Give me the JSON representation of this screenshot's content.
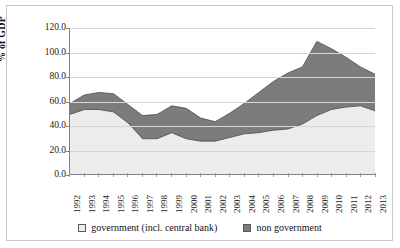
{
  "chart_data": {
    "type": "area",
    "title": "",
    "subtitle": "",
    "xlabel": "",
    "ylabel": "% of GDP",
    "stacked": true,
    "grid": true,
    "legend_position": "bottom",
    "ylim": [
      0,
      120
    ],
    "yticks": [
      "0.0",
      "20.0",
      "40.0",
      "60.0",
      "80.0",
      "100.0",
      "120.0"
    ],
    "ytick_values": [
      0,
      20,
      40,
      60,
      80,
      100,
      120
    ],
    "categories": [
      "1992",
      "1993",
      "1994",
      "1995",
      "1996",
      "1997",
      "1998",
      "1999",
      "2000",
      "2001",
      "2002",
      "2003",
      "2004",
      "2005",
      "2006",
      "2007",
      "2008",
      "2009",
      "2010",
      "2011",
      "2012",
      "2013"
    ],
    "series": [
      {
        "name": "government (incl. central bank)",
        "color": "#ececec",
        "values": [
          49,
          53,
          53,
          51,
          42,
          29,
          29,
          34,
          29,
          27,
          27,
          30,
          33,
          34,
          36,
          37,
          41,
          48,
          53,
          55,
          56,
          52
        ]
      },
      {
        "name": "non government",
        "color": "#7c7c7c",
        "values": [
          9,
          12,
          14,
          15,
          15,
          19,
          20,
          22,
          25,
          19,
          16,
          20,
          25,
          33,
          40,
          46,
          47,
          61,
          50,
          41,
          32,
          30
        ]
      }
    ],
    "totals": [
      58,
      65,
      67,
      66,
      57,
      48,
      49,
      56,
      54,
      46,
      43,
      50,
      58,
      67,
      76,
      83,
      88,
      109,
      103,
      96,
      88,
      82
    ]
  },
  "legend": {
    "items": [
      {
        "label": "government (incl. central bank)",
        "swatch": "legend-swatch-government"
      },
      {
        "label": "non government",
        "swatch": "legend-swatch-non-government"
      }
    ]
  },
  "axis": {
    "y_title": "% of GDP"
  }
}
